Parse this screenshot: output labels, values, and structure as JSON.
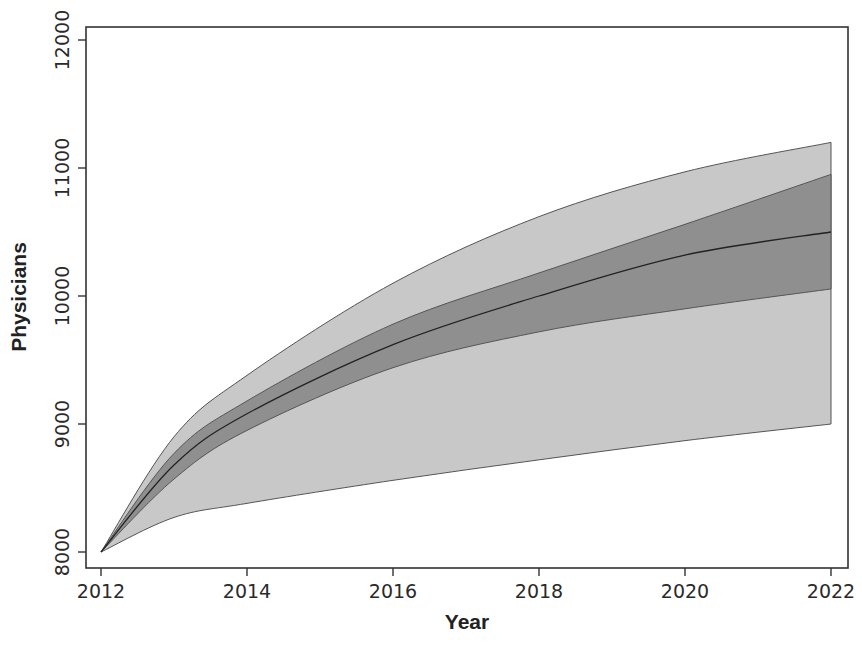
{
  "chart_data": {
    "type": "area",
    "title": "",
    "xlabel": "Year",
    "ylabel": "Physicians",
    "xlim": [
      2012,
      2022
    ],
    "ylim": [
      7900,
      12100
    ],
    "x_ticks": [
      2012,
      2014,
      2016,
      2018,
      2020,
      2022
    ],
    "y_ticks": [
      8000,
      9000,
      10000,
      11000,
      12000
    ],
    "grid": false,
    "legend": null,
    "x": [
      2012,
      2013,
      2014,
      2016,
      2018,
      2020,
      2022
    ],
    "series": [
      {
        "name": "outer_upper",
        "values": [
          8000,
          8900,
          9380,
          10100,
          10620,
          10970,
          11200
        ]
      },
      {
        "name": "inner_upper",
        "values": [
          8000,
          8770,
          9180,
          9780,
          10180,
          10560,
          10950
        ]
      },
      {
        "name": "median",
        "values": [
          8000,
          8680,
          9080,
          9620,
          10000,
          10320,
          10500
        ]
      },
      {
        "name": "inner_lower",
        "values": [
          8000,
          8570,
          8950,
          9440,
          9720,
          9900,
          10055
        ]
      },
      {
        "name": "outer_lower",
        "values": [
          8000,
          8270,
          8380,
          8560,
          8720,
          8870,
          9000
        ]
      }
    ],
    "bands": [
      {
        "name": "outer_interval",
        "lower": "outer_lower",
        "upper": "outer_upper",
        "color": "#c8c8c8"
      },
      {
        "name": "inner_interval",
        "lower": "inner_lower",
        "upper": "inner_upper",
        "color": "#8f8f8f"
      }
    ],
    "colors": {
      "outer_band": "#c9c9c9",
      "inner_band": "#8e8e8e",
      "line": "#333333",
      "frame": "#333333"
    }
  },
  "labels": {
    "xlabel": "Year",
    "ylabel": "Physicians",
    "x_ticks": [
      "2012",
      "2014",
      "2016",
      "2018",
      "2020",
      "2022"
    ],
    "y_ticks": [
      "8000",
      "9000",
      "10000",
      "11000",
      "12000"
    ]
  }
}
